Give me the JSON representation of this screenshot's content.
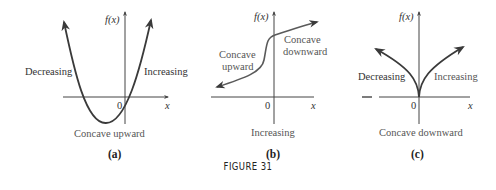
{
  "figure": {
    "title": "FIGURE 31",
    "panels": [
      {
        "caption": "(a)",
        "y_axis_label": "f(x)",
        "x_axis_label": "x",
        "origin_label": "0",
        "left_label": "Decreasing",
        "right_label": "Increasing",
        "bottom_label": "Concave upward"
      },
      {
        "caption": "(b)",
        "y_axis_label": "f(x)",
        "x_axis_label": "x",
        "origin_label": "0",
        "left_label_line1": "Concave",
        "left_label_line2": "upward",
        "right_label_line1": "Concave",
        "right_label_line2": "downward",
        "bottom_label": "Increasing"
      },
      {
        "caption": "(c)",
        "y_axis_label": "f(x)",
        "x_axis_label": "x",
        "origin_label": "0",
        "left_label": "Decreasing",
        "right_label": "Increasing",
        "bottom_label": "Concave downward"
      }
    ]
  },
  "colors": {
    "axis": "#444444",
    "curve": "#3a3a3a",
    "label": "#555555"
  }
}
